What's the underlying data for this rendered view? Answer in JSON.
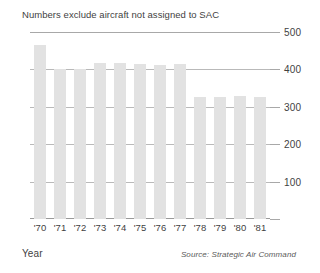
{
  "chart_data": {
    "type": "bar",
    "title": "Numbers exclude aircraft not assigned to SAC",
    "xlabel": "Year",
    "ylabel": "",
    "categories": [
      "'70",
      "'71",
      "'72",
      "'73",
      "'74",
      "'75",
      "'76",
      "'77",
      "'78",
      "'79",
      "'80",
      "'81"
    ],
    "values": [
      465,
      402,
      400,
      418,
      418,
      415,
      412,
      415,
      327,
      327,
      330,
      327
    ],
    "series": [
      {
        "name": "Aircraft assigned to SAC",
        "values": [
          465,
          402,
          400,
          418,
          418,
          415,
          412,
          415,
          327,
          327,
          330,
          327
        ]
      }
    ],
    "ylim": [
      0,
      500
    ],
    "yticks": [
      100,
      200,
      300,
      400,
      500
    ],
    "ytick_labels": [
      "100",
      "200",
      "300",
      "400",
      "500"
    ],
    "grid": true,
    "legend": "none",
    "bar_color": "#e2e2e2",
    "gridline_color": "#b9b9b9",
    "axis_color": "#9a9a9a",
    "text_color": "#3f3f3f"
  },
  "footer": {
    "source": "Source: Strategic Air Command"
  }
}
